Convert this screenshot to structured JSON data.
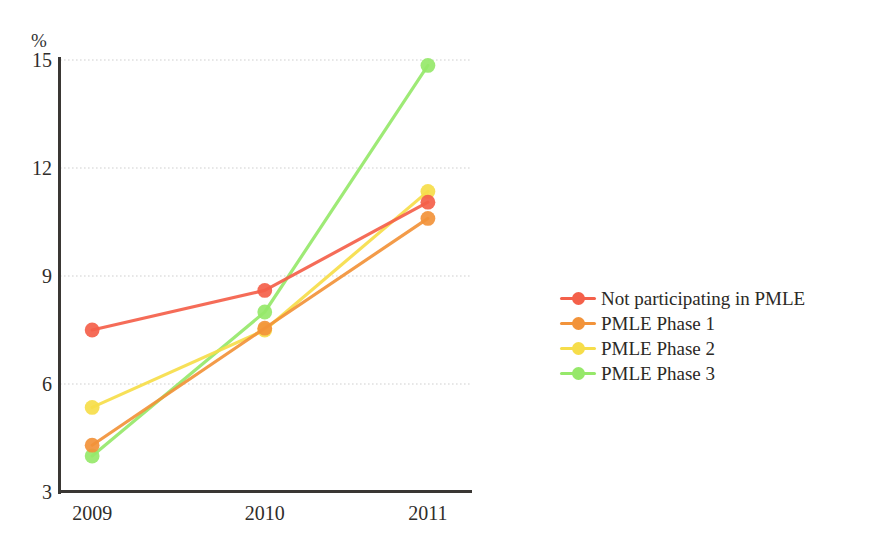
{
  "chart_data": {
    "type": "line",
    "title": "",
    "subtitle": "",
    "xlabel": "",
    "ylabel": "",
    "unit_label": "%",
    "categories": [
      "2009",
      "2010",
      "2011"
    ],
    "x": [
      2009,
      2010,
      2011
    ],
    "ylim": [
      3,
      15
    ],
    "xlim": [
      2009,
      2011
    ],
    "yticks": [
      3,
      6,
      9,
      12,
      15
    ],
    "ytick_labels": [
      "3",
      "6",
      "9",
      "12",
      "15"
    ],
    "xtick_labels": [
      "2009",
      "2010",
      "2011"
    ],
    "grid": "horizontal-dotted",
    "legend_position": "right",
    "marker": "circle",
    "series": [
      {
        "name": "Not participating in PMLE",
        "color": "#f4604a",
        "values": [
          7.5,
          8.6,
          11.05
        ]
      },
      {
        "name": "PMLE Phase 1",
        "color": "#f2933a",
        "values": [
          4.3,
          7.55,
          10.6
        ]
      },
      {
        "name": "PMLE Phase 2",
        "color": "#f6dd4a",
        "values": [
          5.35,
          7.5,
          11.35
        ]
      },
      {
        "name": "PMLE Phase 3",
        "color": "#96e86a",
        "values": [
          4.0,
          8.0,
          14.85
        ]
      }
    ],
    "annotations": []
  },
  "legend": {
    "entries": [
      {
        "label": "Not participating in PMLE",
        "color": "#f4604a"
      },
      {
        "label": "PMLE Phase 1",
        "color": "#f2933a"
      },
      {
        "label": "PMLE Phase 2",
        "color": "#f6dd4a"
      },
      {
        "label": "PMLE Phase 3",
        "color": "#96e86a"
      }
    ]
  },
  "axes": {
    "unit_label": "%",
    "y_tick_labels": [
      "15",
      "12",
      "9",
      "6",
      "3"
    ],
    "x_tick_labels": [
      "2009",
      "2010",
      "2011"
    ],
    "axis_color": "#3a3734",
    "gridline_color": "#cfcfcf"
  }
}
